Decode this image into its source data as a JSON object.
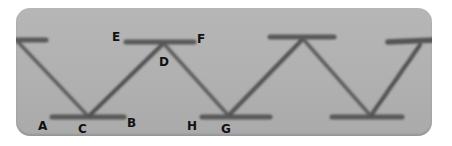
{
  "figure": {
    "colors": {
      "fabric": "#b2b2b2",
      "thread": "#555555",
      "label": "#111111",
      "background": "#ffffff"
    },
    "labels": [
      {
        "id": "A",
        "text": "A",
        "x": 38,
        "y": 120
      },
      {
        "id": "C",
        "text": "C",
        "x": 78,
        "y": 123
      },
      {
        "id": "B",
        "text": "B",
        "x": 127,
        "y": 117
      },
      {
        "id": "E",
        "text": "E",
        "x": 112,
        "y": 31
      },
      {
        "id": "F",
        "text": "F",
        "x": 197,
        "y": 33
      },
      {
        "id": "D",
        "text": "D",
        "x": 159,
        "y": 56
      },
      {
        "id": "H",
        "text": "H",
        "x": 187,
        "y": 120
      },
      {
        "id": "G",
        "text": "G",
        "x": 221,
        "y": 123
      }
    ]
  }
}
